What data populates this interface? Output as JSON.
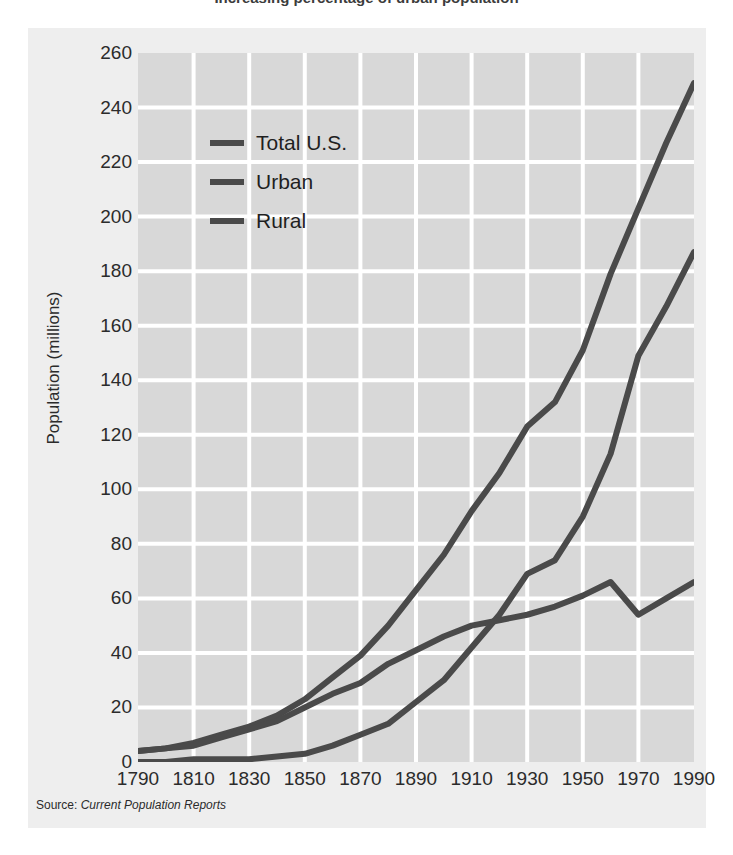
{
  "title": "Increasing percentage of urban population",
  "source": {
    "prefix": "Source:",
    "title": "Current Population Reports"
  },
  "legend": {
    "position": "inside-top-left",
    "items": [
      {
        "label": "Total U.S.",
        "color": "#4a4a4a"
      },
      {
        "label": "Urban",
        "color": "#4a4a4a"
      },
      {
        "label": "Rural",
        "color": "#4a4a4a"
      }
    ]
  },
  "colors": {
    "page_background": "#ffffff",
    "panel_background": "#eeeeee",
    "plot_background": "#d8d8d8",
    "gridline": "#ffffff",
    "line": "#4a4a4a",
    "text": "#2b2b2b"
  },
  "chart_data": {
    "type": "line",
    "title": "Increasing percentage of urban population",
    "xlabel": "",
    "ylabel": "Population (millions)",
    "xlim": [
      1790,
      1990
    ],
    "ylim": [
      0,
      260
    ],
    "xticks": [
      1790,
      1810,
      1830,
      1850,
      1870,
      1890,
      1910,
      1930,
      1950,
      1970,
      1990
    ],
    "yticks": [
      0,
      20,
      40,
      60,
      80,
      100,
      120,
      140,
      160,
      180,
      200,
      220,
      240,
      260
    ],
    "grid": true,
    "legend_position": "upper left",
    "x": [
      1790,
      1800,
      1810,
      1820,
      1830,
      1840,
      1850,
      1860,
      1870,
      1880,
      1890,
      1900,
      1910,
      1920,
      1930,
      1940,
      1950,
      1960,
      1970,
      1980,
      1990
    ],
    "series": [
      {
        "name": "Total U.S.",
        "color": "#4a4a4a",
        "values": [
          4,
          5,
          7,
          10,
          13,
          17,
          23,
          31,
          39,
          50,
          63,
          76,
          92,
          106,
          123,
          132,
          151,
          179,
          203,
          227,
          249
        ]
      },
      {
        "name": "Urban",
        "color": "#4a4a4a",
        "values": [
          0,
          0,
          1,
          1,
          1,
          2,
          3,
          6,
          10,
          14,
          22,
          30,
          42,
          54,
          69,
          74,
          90,
          113,
          149,
          167,
          187
        ]
      },
      {
        "name": "Rural",
        "color": "#4a4a4a",
        "values": [
          4,
          5,
          6,
          9,
          12,
          15,
          20,
          25,
          29,
          36,
          41,
          46,
          50,
          52,
          54,
          57,
          61,
          66,
          54,
          60,
          66
        ]
      }
    ]
  }
}
